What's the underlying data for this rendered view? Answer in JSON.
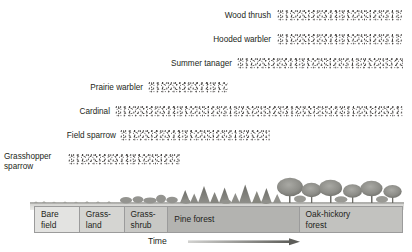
{
  "figure": {
    "axis": {
      "time_label": "Time",
      "arrow_direction": "left-to-right"
    },
    "colors": {
      "text": "#231f20",
      "stipple": "#46433f",
      "zone_bare_field": "#e3e3e1",
      "zone_grassland": "#d5d5d2",
      "zone_grass_shrub": "#c8c8c5",
      "zone_pine_forest": "#b3b3b0",
      "zone_oak_hickory": "#c2c2bf",
      "border": "#9b9b9b",
      "arrow": "#6f6f6f"
    }
  },
  "species": [
    {
      "name": "Wood thrush",
      "label_x": 207,
      "label_y": 11,
      "label_w": 64,
      "band_x": 277,
      "band_y": 10,
      "band_w": 126,
      "profile": "rising",
      "peak_density": 0.85
    },
    {
      "name": "Hooded warbler",
      "label_x": 188,
      "label_y": 35,
      "label_w": 83,
      "band_x": 277,
      "band_y": 34,
      "band_w": 126,
      "profile": "rising",
      "peak_density": 0.9
    },
    {
      "name": "Summer tanager",
      "label_x": 147,
      "label_y": 59,
      "label_w": 85,
      "band_x": 237,
      "band_y": 58,
      "band_w": 166,
      "profile": "mid-peak",
      "peak_density": 0.95
    },
    {
      "name": "Prairie warbler",
      "label_x": 64,
      "label_y": 83,
      "label_w": 79,
      "band_x": 148,
      "band_y": 82,
      "band_w": 80,
      "profile": "low-flat",
      "peak_density": 0.32
    },
    {
      "name": "Cardinal",
      "label_x": 64,
      "label_y": 107,
      "label_w": 46,
      "band_x": 115,
      "band_y": 106,
      "band_w": 288,
      "profile": "rising",
      "peak_density": 0.88
    },
    {
      "name": "Field sparrow",
      "label_x": 48,
      "label_y": 131,
      "label_w": 68,
      "band_x": 120,
      "band_y": 130,
      "band_w": 150,
      "profile": "early-peak",
      "peak_density": 0.8
    },
    {
      "name": "Grasshopper sparrow",
      "label_x": 4,
      "label_y": 152,
      "label_w": 62,
      "band_x": 68,
      "band_y": 154,
      "band_w": 112,
      "profile": "early-peak",
      "peak_density": 0.85
    }
  ],
  "habitat_zones": [
    {
      "label": "Bare\nfield",
      "x": 34,
      "width": 45,
      "color": "#e3e3e1"
    },
    {
      "label": "Grass-\nland",
      "x": 79,
      "width": 45,
      "color": "#d5d5d2"
    },
    {
      "label": "Grass-\nshrub",
      "x": 124,
      "width": 44,
      "color": "#c8c8c5"
    },
    {
      "label": "Pine forest",
      "x": 168,
      "width": 132,
      "color": "#b3b3b0"
    },
    {
      "label": "Oak-hickory\nforest",
      "x": 300,
      "width": 103,
      "color": "#c2c2bf"
    }
  ],
  "chart_data": {
    "type": "area",
    "xlabel": "Time",
    "ylabel": "",
    "categories": [
      "Bare field",
      "Grassland",
      "Grass-shrub",
      "Pine forest",
      "Oak-hickory forest"
    ],
    "series": [
      {
        "name": "Wood thrush",
        "values": [
          0,
          0,
          0,
          0.35,
          0.85
        ]
      },
      {
        "name": "Hooded warbler",
        "values": [
          0,
          0,
          0,
          0.3,
          0.9
        ]
      },
      {
        "name": "Summer tanager",
        "values": [
          0,
          0,
          0.1,
          0.95,
          0.45
        ]
      },
      {
        "name": "Prairie warbler",
        "values": [
          0,
          0.05,
          0.32,
          0.1,
          0
        ]
      },
      {
        "name": "Cardinal",
        "values": [
          0,
          0.15,
          0.35,
          0.6,
          0.88
        ]
      },
      {
        "name": "Field sparrow",
        "values": [
          0,
          0.55,
          0.8,
          0.2,
          0
        ]
      },
      {
        "name": "Grasshopper sparrow",
        "values": [
          0.2,
          0.85,
          0.3,
          0,
          0
        ]
      }
    ],
    "legend": "none",
    "grid": false
  }
}
